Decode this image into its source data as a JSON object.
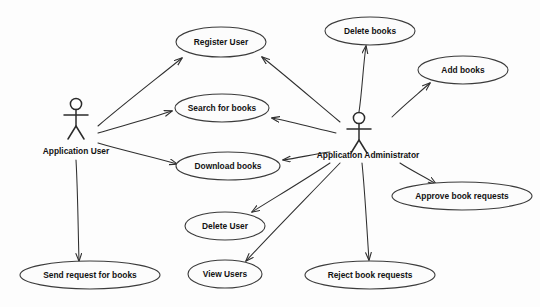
{
  "diagram": {
    "type": "uml-use-case-diagram",
    "background_color": "#fdfdfd",
    "line_color": "#2f2f2f",
    "ellipse_fill": "#fcfcfc",
    "ellipse_stroke": "#3b3b3b",
    "text_color": "#131313"
  },
  "actors": [
    {
      "id": "application-user",
      "label": "Application User",
      "x": 76,
      "y": 104,
      "label_x": 76,
      "label_y": 152
    },
    {
      "id": "application-administrator",
      "label": "Application Administrator",
      "x": 359,
      "y": 118,
      "label_x": 368,
      "label_y": 156
    }
  ],
  "use_cases": [
    {
      "id": "register-user",
      "label": "Register User",
      "cx": 221,
      "cy": 42,
      "rx": 45,
      "ry": 15
    },
    {
      "id": "search-for-books",
      "label": "Search for books",
      "cx": 222,
      "cy": 108,
      "rx": 47,
      "ry": 14
    },
    {
      "id": "download-books",
      "label": "Download books",
      "cx": 228,
      "cy": 166,
      "rx": 52,
      "ry": 14
    },
    {
      "id": "send-request-for-books",
      "label": "Send request for books",
      "cx": 90,
      "cy": 275,
      "rx": 70,
      "ry": 14
    },
    {
      "id": "delete-user",
      "label": "Delete User",
      "cx": 225,
      "cy": 226,
      "rx": 40,
      "ry": 14
    },
    {
      "id": "view-users",
      "label": "View Users",
      "cx": 225,
      "cy": 274,
      "rx": 37,
      "ry": 14
    },
    {
      "id": "delete-books",
      "label": "Delete books",
      "cx": 370,
      "cy": 31,
      "rx": 45,
      "ry": 14
    },
    {
      "id": "add-books",
      "label": "Add books",
      "cx": 463,
      "cy": 70,
      "rx": 45,
      "ry": 14
    },
    {
      "id": "approve-book-requests",
      "label": "Approve book requests",
      "cx": 462,
      "cy": 196,
      "rx": 70,
      "ry": 14
    },
    {
      "id": "reject-book-requests",
      "label": "Reject book requests",
      "cx": 370,
      "cy": 275,
      "rx": 65,
      "ry": 14
    }
  ],
  "associations": [
    {
      "id": "user-to-register-user",
      "from": "application-user",
      "to": "register-user",
      "x1": 98,
      "y1": 126,
      "x2": 182,
      "y2": 58
    },
    {
      "id": "user-to-search-for-books",
      "from": "application-user",
      "to": "search-for-books",
      "x1": 98,
      "y1": 133,
      "x2": 172,
      "y2": 111
    },
    {
      "id": "user-to-download-books",
      "from": "application-user",
      "to": "download-books",
      "x1": 98,
      "y1": 143,
      "x2": 177,
      "y2": 164
    },
    {
      "id": "user-to-send-request",
      "from": "application-user",
      "to": "send-request-for-books",
      "x1": 76,
      "y1": 160,
      "x2": 79,
      "y2": 261
    },
    {
      "id": "admin-to-register-user",
      "from": "application-administrator",
      "to": "register-user",
      "x1": 340,
      "y1": 122,
      "x2": 262,
      "y2": 57
    },
    {
      "id": "admin-to-delete-books",
      "from": "application-administrator",
      "to": "delete-books",
      "x1": 359,
      "y1": 112,
      "x2": 366,
      "y2": 46
    },
    {
      "id": "admin-to-add-books",
      "from": "application-administrator",
      "to": "add-books",
      "x1": 392,
      "y1": 117,
      "x2": 430,
      "y2": 83
    },
    {
      "id": "admin-to-search-for-books",
      "from": "application-administrator",
      "to": "search-for-books",
      "x1": 336,
      "y1": 133,
      "x2": 272,
      "y2": 118
    },
    {
      "id": "admin-to-download-books",
      "from": "application-administrator",
      "to": "download-books",
      "x1": 330,
      "y1": 152,
      "x2": 283,
      "y2": 160
    },
    {
      "id": "admin-to-delete-user",
      "from": "application-administrator",
      "to": "delete-user",
      "x1": 330,
      "y1": 163,
      "x2": 252,
      "y2": 212
    },
    {
      "id": "admin-to-view-users",
      "from": "application-administrator",
      "to": "view-users",
      "x1": 340,
      "y1": 163,
      "x2": 246,
      "y2": 261
    },
    {
      "id": "admin-to-approve-requests",
      "from": "application-administrator",
      "to": "approve-book-requests",
      "x1": 400,
      "y1": 163,
      "x2": 436,
      "y2": 184
    },
    {
      "id": "admin-to-reject-requests",
      "from": "application-administrator",
      "to": "reject-book-requests",
      "x1": 362,
      "y1": 163,
      "x2": 369,
      "y2": 260
    }
  ]
}
